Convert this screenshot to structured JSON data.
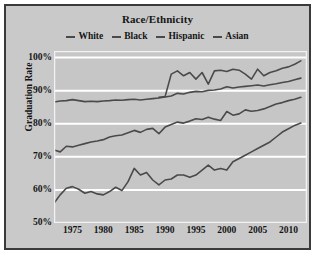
{
  "chart_data": {
    "type": "line",
    "title": "Race/Ethnicity",
    "xlabel": "",
    "ylabel": "Graduation Rate",
    "xlim": [
      1972,
      2013
    ],
    "ylim": [
      50,
      102
    ],
    "grid": true,
    "grid_orientation": "horizontal",
    "legend_position": "top-center",
    "xticks": [
      1975,
      1980,
      1985,
      1990,
      1995,
      2000,
      2005,
      2010
    ],
    "yticks": [
      "50%",
      "60%",
      "70%",
      "80%",
      "90%",
      "100%"
    ],
    "ytick_values": [
      50,
      60,
      70,
      80,
      90,
      100
    ],
    "plot_background": "#c6c6c6",
    "gridline_color": "#ffffff",
    "line_color": "#4a4a4a",
    "series": [
      {
        "name": "White",
        "color": "#4a4a4a",
        "x": [
          1972,
          1973,
          1974,
          1975,
          1976,
          1977,
          1978,
          1979,
          1980,
          1981,
          1982,
          1983,
          1984,
          1985,
          1986,
          1987,
          1988,
          1989,
          1990,
          1991,
          1992,
          1993,
          1994,
          1995,
          1996,
          1997,
          1998,
          1999,
          2000,
          2001,
          2002,
          2003,
          2004,
          2005,
          2006,
          2007,
          2008,
          2009,
          2010,
          2011,
          2012
        ],
        "values": [
          86.6,
          86.9,
          87.0,
          87.3,
          87.0,
          86.7,
          86.8,
          86.7,
          86.9,
          87.0,
          87.2,
          87.1,
          87.3,
          87.4,
          87.2,
          87.4,
          87.6,
          87.8,
          88.1,
          88.4,
          89.2,
          89.0,
          89.5,
          89.8,
          89.7,
          90.1,
          90.2,
          90.5,
          91.2,
          90.8,
          91.1,
          91.3,
          91.5,
          91.7,
          91.4,
          91.8,
          92.1,
          92.5,
          92.8,
          93.3,
          93.8
        ]
      },
      {
        "name": "Black",
        "color": "#4a4a4a",
        "x": [
          1972,
          1973,
          1974,
          1975,
          1976,
          1977,
          1978,
          1979,
          1980,
          1981,
          1982,
          1983,
          1984,
          1985,
          1986,
          1987,
          1988,
          1989,
          1990,
          1991,
          1992,
          1993,
          1994,
          1995,
          1996,
          1997,
          1998,
          1999,
          2000,
          2001,
          2002,
          2003,
          2004,
          2005,
          2006,
          2007,
          2008,
          2009,
          2010,
          2011,
          2012
        ],
        "values": [
          72.1,
          71.5,
          73.2,
          73.0,
          73.5,
          74.0,
          74.5,
          74.8,
          75.2,
          76.0,
          76.4,
          76.6,
          77.3,
          78.0,
          77.4,
          78.3,
          78.6,
          77.0,
          79.0,
          79.8,
          80.5,
          80.2,
          80.8,
          81.5,
          81.3,
          82.0,
          81.4,
          81.0,
          83.7,
          82.6,
          83.0,
          84.2,
          83.8,
          84.0,
          84.5,
          85.2,
          86.0,
          86.4,
          87.0,
          87.4,
          88.0
        ]
      },
      {
        "name": "Hispanic",
        "color": "#4a4a4a",
        "x": [
          1972,
          1973,
          1974,
          1975,
          1976,
          1977,
          1978,
          1979,
          1980,
          1981,
          1982,
          1983,
          1984,
          1985,
          1986,
          1987,
          1988,
          1989,
          1990,
          1991,
          1992,
          1993,
          1994,
          1995,
          1996,
          1997,
          1998,
          1999,
          2000,
          2001,
          2002,
          2003,
          2004,
          2005,
          2006,
          2007,
          2008,
          2009,
          2010,
          2011,
          2012
        ],
        "values": [
          56.0,
          58.5,
          60.5,
          61.0,
          60.2,
          59.0,
          59.5,
          58.8,
          58.5,
          59.5,
          60.8,
          59.8,
          62.5,
          66.5,
          64.5,
          65.3,
          63.0,
          61.5,
          63.0,
          63.3,
          64.5,
          64.5,
          63.8,
          64.5,
          66.0,
          67.5,
          66.0,
          66.5,
          66.0,
          68.5,
          69.5,
          70.5,
          71.5,
          72.5,
          73.5,
          74.5,
          76.0,
          77.5,
          78.5,
          79.5,
          80.2
        ]
      },
      {
        "name": "Asian",
        "color": "#4a4a4a",
        "x": [
          1989,
          1990,
          1991,
          1992,
          1993,
          1994,
          1995,
          1996,
          1997,
          1998,
          1999,
          2000,
          2001,
          2002,
          2003,
          2004,
          2005,
          2006,
          2007,
          2008,
          2009,
          2010,
          2011,
          2012
        ],
        "values": [
          88.0,
          88.2,
          95.0,
          96.0,
          94.5,
          95.5,
          93.5,
          95.5,
          92.0,
          96.0,
          96.2,
          95.8,
          96.5,
          96.2,
          95.0,
          93.5,
          96.5,
          94.5,
          95.5,
          96.0,
          96.8,
          97.2,
          98.0,
          99.0
        ]
      }
    ]
  }
}
